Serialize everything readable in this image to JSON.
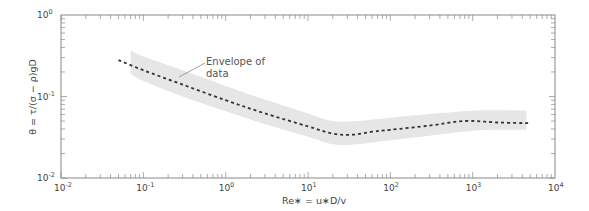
{
  "chart_data": {
    "type": "line",
    "title": "",
    "xlabel": "Re∗ = u∗D/v",
    "ylabel": "θ = τ/(σ − ρ)gD",
    "xscale": "log",
    "yscale": "log",
    "xlim": [
      0.01,
      10000
    ],
    "ylim": [
      0.01,
      1
    ],
    "x_tick_labels": [
      "10^-2",
      "10^-1",
      "10^0",
      "10^1",
      "10^2",
      "10^3",
      "10^4"
    ],
    "y_tick_labels": [
      "10^-2",
      "10^-1",
      "10^0"
    ],
    "grid": false,
    "legend": null,
    "annotations": [
      {
        "text_lines": [
          "Envelope of",
          "data"
        ],
        "points_to": "envelope"
      }
    ],
    "series": [
      {
        "name": "Mean curve (dashed)",
        "style": "dashed",
        "x": [
          0.05,
          0.1,
          0.3,
          1,
          3,
          10,
          20,
          35,
          60,
          100,
          300,
          800,
          2000,
          5000
        ],
        "y": [
          0.28,
          0.21,
          0.14,
          0.09,
          0.062,
          0.043,
          0.035,
          0.034,
          0.037,
          0.039,
          0.044,
          0.05,
          0.048,
          0.047
        ]
      },
      {
        "name": "Envelope of data",
        "style": "band",
        "x": [
          0.07,
          0.1,
          0.3,
          1,
          3,
          10,
          20,
          40,
          100,
          300,
          1000,
          2000,
          4500
        ],
        "upper": [
          0.37,
          0.31,
          0.21,
          0.135,
          0.092,
          0.062,
          0.05,
          0.05,
          0.055,
          0.061,
          0.067,
          0.068,
          0.067
        ],
        "lower": [
          0.19,
          0.155,
          0.1,
          0.066,
          0.046,
          0.032,
          0.026,
          0.026,
          0.029,
          0.033,
          0.038,
          0.039,
          0.039
        ]
      }
    ]
  },
  "axes": {
    "x_ticks": [
      {
        "label_base": "10",
        "label_exp": "-2"
      },
      {
        "label_base": "10",
        "label_exp": "-1"
      },
      {
        "label_base": "10",
        "label_exp": "0"
      },
      {
        "label_base": "10",
        "label_exp": "1"
      },
      {
        "label_base": "10",
        "label_exp": "2"
      },
      {
        "label_base": "10",
        "label_exp": "3"
      },
      {
        "label_base": "10",
        "label_exp": "4"
      }
    ],
    "y_ticks": [
      {
        "label_base": "10",
        "label_exp": "0"
      },
      {
        "label_base": "10",
        "label_exp": "-1"
      },
      {
        "label_base": "10",
        "label_exp": "-2"
      }
    ],
    "xlabel": "Re∗ = u∗D/v",
    "ylabel": "θ = τ/(σ − ρ)gD"
  },
  "annotation": {
    "line1": "Envelope of",
    "line2": "data"
  },
  "colors": {
    "envelope": "#e6e6e6",
    "curve": "#333333",
    "frame": "#888888"
  }
}
